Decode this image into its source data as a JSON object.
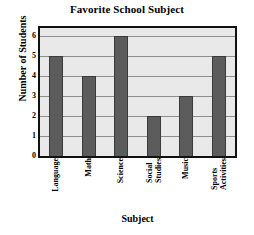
{
  "chart_data": {
    "type": "bar",
    "title": "Favorite School Subject",
    "xlabel": "Subject",
    "ylabel": "Number of Students",
    "categories": [
      "Language",
      "Math",
      "Science",
      "Social Studies",
      "Music",
      "Sports Activities"
    ],
    "category_lines": [
      [
        "Language"
      ],
      [
        "Math"
      ],
      [
        "Science"
      ],
      [
        "Social",
        "Studies"
      ],
      [
        "Music"
      ],
      [
        "Sports",
        "Activities"
      ]
    ],
    "values": [
      5,
      4,
      6,
      2,
      3,
      5
    ],
    "ylim": [
      0,
      6.4
    ],
    "yticks": [
      0,
      1,
      2,
      3,
      4,
      5,
      6
    ],
    "ytick_labels": [
      "0",
      "1",
      "2",
      "3",
      "4",
      "5",
      "6"
    ],
    "grid": true,
    "legend": "none",
    "colors": {
      "bar": "#5c5c5c",
      "bar_edge": "#3a3a3a",
      "plot_background": "#e9e9e9",
      "frame": "#111111",
      "gridline": "#8d8d8d",
      "page_background": "#ffffff",
      "text": "#000000"
    }
  }
}
